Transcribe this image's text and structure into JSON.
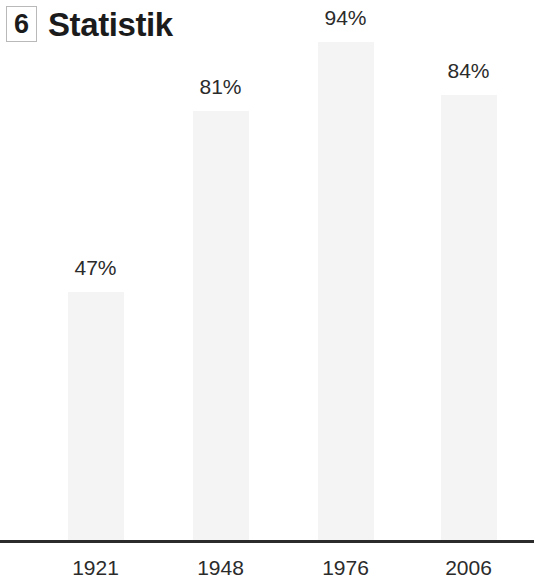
{
  "header": {
    "chapter_number": "6",
    "title": "Statistik"
  },
  "chart_data": {
    "type": "bar",
    "title": "Statistik",
    "xlabel": "",
    "ylabel": "",
    "ylim": [
      0,
      100
    ],
    "grid": false,
    "legend": null,
    "categories": [
      "1921",
      "1948",
      "1976",
      "2006"
    ],
    "values": [
      47,
      81,
      94,
      84
    ],
    "value_labels": [
      "47%",
      "81%",
      "94%",
      "84%"
    ],
    "unit": "%",
    "bar_color": "#f4f4f4",
    "axis_color": "#2b2b2b",
    "text_color": "#2b2b2b"
  }
}
